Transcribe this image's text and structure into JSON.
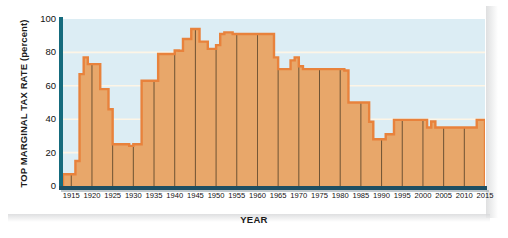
{
  "chart_data": {
    "type": "area",
    "title": "",
    "xlabel": "YEAR",
    "ylabel": "TOP MARGINAL TAX RATE (percent)",
    "ylim": [
      0,
      100
    ],
    "xlim": [
      1913,
      2015
    ],
    "yticks": [
      0,
      20,
      40,
      60,
      80,
      100
    ],
    "xticks": [
      1915,
      1920,
      1925,
      1930,
      1935,
      1940,
      1945,
      1950,
      1955,
      1960,
      1965,
      1970,
      1975,
      1980,
      1985,
      1990,
      1995,
      2000,
      2005,
      2010,
      2015
    ],
    "grid": "horizontal-white-and-vertical-dark",
    "legend": "none",
    "series": [
      {
        "name": "Top marginal tax rate",
        "step": "post",
        "x": [
          1913,
          1916,
          1917,
          1918,
          1919,
          1922,
          1924,
          1925,
          1929,
          1930,
          1932,
          1936,
          1938,
          1940,
          1941,
          1942,
          1944,
          1946,
          1948,
          1950,
          1951,
          1952,
          1954,
          1964,
          1965,
          1968,
          1969,
          1970,
          1971,
          1981,
          1982,
          1987,
          1988,
          1991,
          1993,
          2001,
          2002,
          2003,
          2013,
          2015
        ],
        "values": [
          7,
          15,
          67,
          77,
          73,
          58,
          46,
          25,
          24,
          25,
          63,
          79,
          79,
          81.1,
          81,
          88,
          94,
          86.45,
          82.13,
          84.36,
          91,
          92,
          91,
          77,
          70,
          75.25,
          77,
          71.75,
          70,
          69.125,
          50,
          38.5,
          28,
          31,
          39.6,
          35,
          38.6,
          35,
          39.6,
          39.6
        ]
      }
    ]
  },
  "axes": {
    "y_title": "TOP MARGINAL TAX RATE (percent)",
    "y_title_main": "TOP MARGINAL TAX RATE",
    "y_title_unit": "(percent)",
    "x_title": "YEAR"
  },
  "colors": {
    "plot_background": "#dcedf4",
    "area_fill": "#e8a76a",
    "area_stroke": "#e8823c",
    "horizontal_gridline": "#fdf5e6",
    "vertical_gridline": "#4a3a24",
    "y_axis": "#156b7d",
    "x_axis": "#1d4f63",
    "text": "#111111"
  }
}
